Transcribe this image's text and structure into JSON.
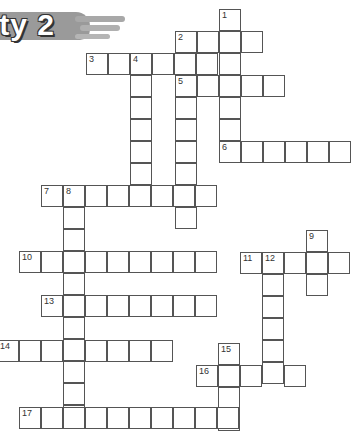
{
  "banner": {
    "title": "ity 2"
  },
  "puzzle": {
    "cell_size": 22,
    "words": [
      {
        "number": "1",
        "direction": "down",
        "x": 219,
        "y": 9,
        "length": 7
      },
      {
        "number": "2",
        "direction": "across",
        "x": 175,
        "y": 31,
        "length": 4
      },
      {
        "number": "3",
        "direction": "across",
        "x": 86,
        "y": 53,
        "length": 7
      },
      {
        "number": "4",
        "direction": "down",
        "x": 130,
        "y": 53,
        "length": 7
      },
      {
        "number": "5",
        "direction": "across",
        "x": 175,
        "y": 75,
        "length": 5
      },
      {
        "number": "",
        "direction": "down",
        "x": 175,
        "y": 75,
        "length": 7
      },
      {
        "number": "6",
        "direction": "across",
        "x": 219,
        "y": 141,
        "length": 6
      },
      {
        "number": "7",
        "direction": "across",
        "x": 41,
        "y": 185,
        "length": 8
      },
      {
        "number": "8",
        "direction": "down",
        "x": 63,
        "y": 185,
        "length": 11
      },
      {
        "number": "9",
        "direction": "down",
        "x": 306,
        "y": 230,
        "length": 3
      },
      {
        "number": "10",
        "direction": "across",
        "x": 19,
        "y": 251,
        "length": 9
      },
      {
        "number": "11",
        "direction": "across",
        "x": 240,
        "y": 252,
        "length": 5
      },
      {
        "number": "12",
        "direction": "down",
        "x": 262,
        "y": 252,
        "length": 6
      },
      {
        "number": "13",
        "direction": "across",
        "x": 41,
        "y": 295,
        "length": 8
      },
      {
        "number": "14",
        "direction": "across",
        "x": -3,
        "y": 340,
        "length": 8
      },
      {
        "number": "15",
        "direction": "down",
        "x": 218,
        "y": 343,
        "length": 4
      },
      {
        "number": "16",
        "direction": "across",
        "x": 196,
        "y": 365,
        "length": 5
      },
      {
        "number": "17",
        "direction": "across",
        "x": 19,
        "y": 407,
        "length": 10
      }
    ]
  }
}
